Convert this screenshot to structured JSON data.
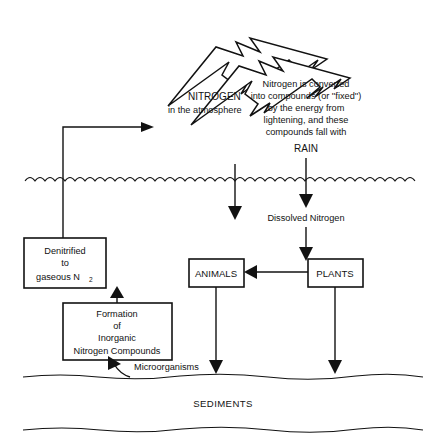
{
  "diagram": {
    "atmosphere": {
      "nitrogen_label_line1": "NITROGEN",
      "nitrogen_label_line2": "in the atmosphere",
      "caption": {
        "line1": "Nitrogen is converted",
        "line2": "into compounds (or ''fixed'')",
        "line3": "by the energy from",
        "line4": "lightening, and these",
        "line5": "compounds fall with"
      },
      "rain_label": "RAIN"
    },
    "water": {
      "dissolved_nitrogen_label": "Dissolved Nitrogen"
    },
    "boxes": [
      {
        "name": "denitrified",
        "line1": "Denitrified",
        "line2": "to",
        "line3_prefix": "gaseous N",
        "line3_subscript": "2"
      },
      {
        "name": "formation",
        "line1": "Formation",
        "line2": "of",
        "line3": "Inorganic",
        "line4": "Nitrogen Compounds"
      },
      {
        "name": "animals",
        "label": "ANIMALS"
      },
      {
        "name": "plants",
        "label": "PLANTS"
      }
    ],
    "microorganisms_label": "Microorganisms",
    "sediments_label": "SEDIMENTS",
    "colors": {
      "ink": "#121212",
      "background": "#ffffff"
    }
  }
}
